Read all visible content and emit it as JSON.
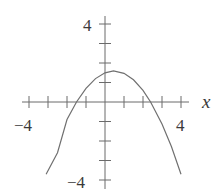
{
  "chart_data": {
    "type": "line",
    "title": "",
    "xlabel": "x",
    "ylabel": "",
    "xlim": [
      -4,
      4
    ],
    "ylim": [
      -4,
      4
    ],
    "grid": false,
    "x_ticks": [
      -4,
      -3,
      -2,
      -1,
      1,
      2,
      3,
      4
    ],
    "y_ticks": [
      -4,
      -3,
      -2,
      -1,
      1,
      2,
      3,
      4
    ],
    "x_tick_labels": [
      {
        "value": -4,
        "label": "−4"
      },
      {
        "value": 4,
        "label": "4"
      }
    ],
    "y_tick_labels": [
      {
        "value": 4,
        "label": "4"
      },
      {
        "value": -4,
        "label": "−4"
      }
    ],
    "series": [
      {
        "name": "parabola",
        "description": "downward-opening parabola, vertex near (0.5, 1.6), x-intercepts near -1.5 and 2.4",
        "equation_estimate": "y = -0.42*(x-0.45)^2 + 1.6",
        "x": [
          -3.1,
          -2.5,
          -2,
          -1.5,
          -1,
          -0.5,
          0,
          0.45,
          1,
          1.5,
          2,
          2.4,
          3,
          3.5,
          4
        ],
        "y": [
          -3.7,
          -2.6,
          -0.9,
          0.0,
          0.7,
          1.2,
          1.5,
          1.6,
          1.47,
          1.14,
          0.6,
          0.0,
          -1.13,
          -2.3,
          -3.7
        ]
      }
    ]
  },
  "labels": {
    "x_axis_name": "x",
    "x_min": "−4",
    "x_max": "4",
    "y_max": "4",
    "y_min": "−4"
  }
}
